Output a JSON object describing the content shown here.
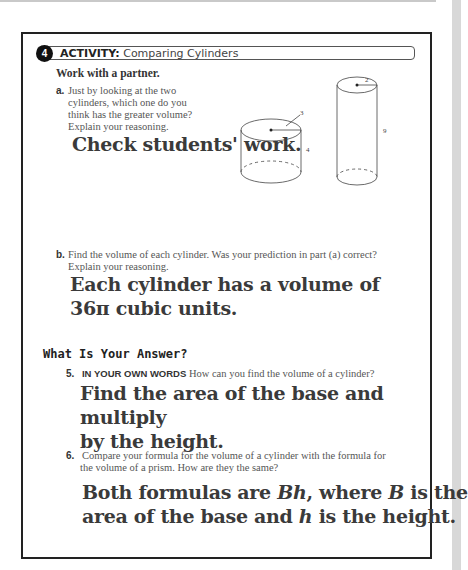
{
  "activity": {
    "number": "4",
    "label": "ACTIVITY:",
    "title": "Comparing Cylinders",
    "instruction": "Work with a partner."
  },
  "questions": {
    "a": {
      "letter": "a.",
      "lines": [
        "Just by looking at the two",
        "cylinders, which one do you",
        "think has the greater volume?",
        "Explain your reasoning."
      ],
      "answer": "Check students' work."
    },
    "b": {
      "letter": "b.",
      "lines": [
        "Find the volume of each cylinder. Was your prediction in part (a) correct?",
        "Explain your reasoning."
      ],
      "answer_line1": "Each cylinder has a volume of",
      "answer_line2": "36π cubic units."
    }
  },
  "figures": {
    "cylinder1": {
      "radius": "3",
      "height": "4"
    },
    "cylinder2": {
      "radius": "2",
      "height": "9"
    }
  },
  "section_title": "What Is Your Answer?",
  "q5": {
    "number": "5.",
    "lead": "IN YOUR OWN WORDS",
    "text": "How can you find the volume of a cylinder?",
    "answer_line1": "Find the area of the base and multiply",
    "answer_line2": "by the height."
  },
  "q6": {
    "number": "6.",
    "line1": "Compare your formula for the volume of a cylinder with the formula for",
    "line2": "the volume of a prism. How are they the same?",
    "answer_p1": "Both formulas are ",
    "answer_bh": "Bh",
    "answer_p2": ", where ",
    "answer_b": "B",
    "answer_p3": " is the",
    "answer_p4": "area of the base and ",
    "answer_h": "h",
    "answer_p5": " is the height."
  }
}
